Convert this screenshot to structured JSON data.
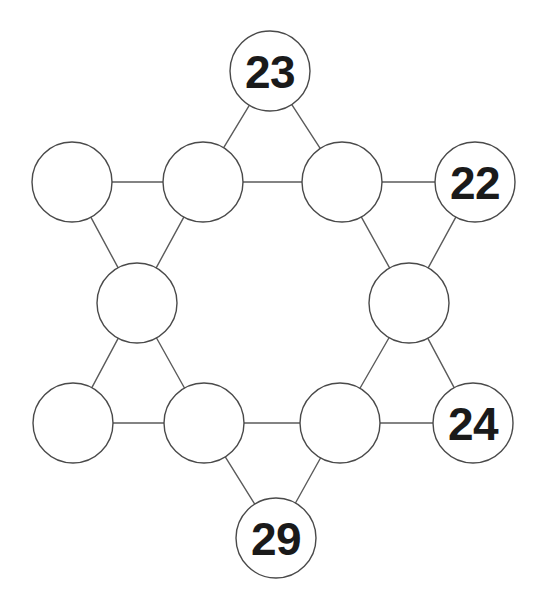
{
  "diagram": {
    "type": "graph",
    "canvas": {
      "width": 544,
      "height": 603
    },
    "background_color": "#ffffff",
    "node_fill_color": "#ffffff",
    "node_stroke_color": "#4a4a4a",
    "edge_color": "#5b5b5b",
    "label_color": "#1a1a1a",
    "node_radius": 40,
    "nodes": [
      {
        "id": "top-point",
        "label": "23",
        "filled": true,
        "cx": 270,
        "cy": 71,
        "r": 40
      },
      {
        "id": "upper-left-outer",
        "label": "",
        "filled": false,
        "cx": 72,
        "cy": 182,
        "r": 40
      },
      {
        "id": "upper-left-inner",
        "label": "",
        "filled": false,
        "cx": 203,
        "cy": 182,
        "r": 40
      },
      {
        "id": "upper-right-inner",
        "label": "",
        "filled": false,
        "cx": 342,
        "cy": 182,
        "r": 40
      },
      {
        "id": "upper-right-outer",
        "label": "22",
        "filled": true,
        "cx": 475,
        "cy": 182,
        "r": 40
      },
      {
        "id": "mid-left-inner",
        "label": "",
        "filled": false,
        "cx": 137,
        "cy": 303,
        "r": 40
      },
      {
        "id": "mid-right-inner",
        "label": "",
        "filled": false,
        "cx": 409,
        "cy": 303,
        "r": 40
      },
      {
        "id": "lower-left-outer",
        "label": "",
        "filled": false,
        "cx": 73,
        "cy": 423,
        "r": 40
      },
      {
        "id": "lower-left-inner",
        "label": "",
        "filled": false,
        "cx": 204,
        "cy": 423,
        "r": 40
      },
      {
        "id": "lower-right-inner",
        "label": "",
        "filled": false,
        "cx": 340,
        "cy": 423,
        "r": 40
      },
      {
        "id": "lower-right-outer",
        "label": "24",
        "filled": true,
        "cx": 473,
        "cy": 423,
        "r": 40
      },
      {
        "id": "bottom-point",
        "label": "29",
        "filled": true,
        "cx": 276,
        "cy": 538,
        "r": 40
      }
    ],
    "edges": [
      {
        "from": "top-point",
        "to": "upper-left-inner"
      },
      {
        "from": "top-point",
        "to": "upper-right-inner"
      },
      {
        "from": "upper-left-outer",
        "to": "upper-left-inner"
      },
      {
        "from": "upper-left-outer",
        "to": "mid-left-inner"
      },
      {
        "from": "upper-left-inner",
        "to": "upper-right-inner"
      },
      {
        "from": "upper-left-inner",
        "to": "mid-left-inner"
      },
      {
        "from": "upper-right-inner",
        "to": "upper-right-outer"
      },
      {
        "from": "upper-right-inner",
        "to": "mid-right-inner"
      },
      {
        "from": "upper-right-outer",
        "to": "mid-right-inner"
      },
      {
        "from": "mid-left-inner",
        "to": "lower-left-outer"
      },
      {
        "from": "mid-left-inner",
        "to": "lower-left-inner"
      },
      {
        "from": "mid-right-inner",
        "to": "lower-right-inner"
      },
      {
        "from": "mid-right-inner",
        "to": "lower-right-outer"
      },
      {
        "from": "lower-left-outer",
        "to": "lower-left-inner"
      },
      {
        "from": "lower-left-inner",
        "to": "lower-right-inner"
      },
      {
        "from": "lower-left-inner",
        "to": "bottom-point"
      },
      {
        "from": "lower-right-inner",
        "to": "lower-right-outer"
      },
      {
        "from": "lower-right-inner",
        "to": "bottom-point"
      }
    ],
    "given_values": [
      "23",
      "22",
      "24",
      "29"
    ],
    "empty_node_count": 8
  }
}
